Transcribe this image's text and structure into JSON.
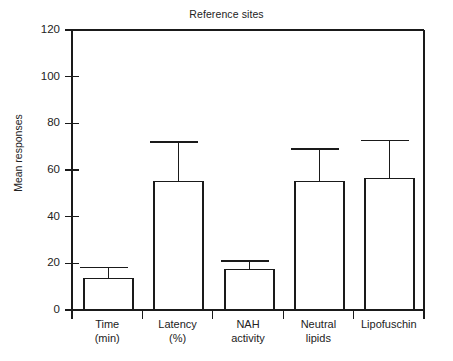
{
  "chart_data": {
    "type": "bar",
    "title": "Reference sites",
    "xlabel": "",
    "ylabel": "Mean responses",
    "categories": [
      "Time (min)",
      "Latency (%)",
      "NAH activity",
      "Neutral lipids",
      "Lipofuschin"
    ],
    "category_lines": [
      [
        "Time",
        "(min)"
      ],
      [
        "Latency",
        "(%)"
      ],
      [
        "NAH",
        "activity"
      ],
      [
        "Neutral",
        "lipids"
      ],
      [
        "Lipofuschin"
      ]
    ],
    "values": [
      13.5,
      55,
      17.3,
      55,
      56.5
    ],
    "error_upper": [
      18.2,
      72,
      21,
      69,
      72.7
    ],
    "ylim": [
      0,
      120
    ],
    "yticks": [
      0,
      20,
      40,
      60,
      80,
      100,
      120
    ],
    "ytick_labels": [
      "0",
      "20",
      "40",
      "60",
      "80",
      "100",
      "120"
    ],
    "grid": false,
    "legend": null,
    "bar_fill": "#ffffff",
    "bar_stroke": "#1a1a1a",
    "axis_color": "#1a1a1a"
  },
  "title": "Reference sites",
  "ylabel": "Mean responses"
}
